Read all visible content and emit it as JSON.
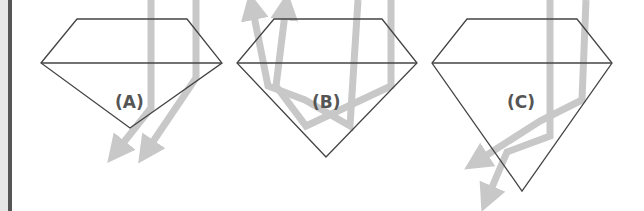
{
  "figure": {
    "colors": {
      "outline": "#444444",
      "ray": "#c8c8c8",
      "label": "#555555",
      "border": "#555555",
      "border_strip": "#e6e6e6"
    },
    "panels": [
      {
        "id": "A",
        "label": "(A)",
        "caption": "Light leaks out the bottom (too deep/shallow pavilion)"
      },
      {
        "id": "B",
        "label": "(B)",
        "caption": "Light reflects back out the top (ideal cut)"
      },
      {
        "id": "C",
        "label": "(C)",
        "caption": "Light leaks out the side/bottom (too deep pavilion)"
      }
    ]
  }
}
